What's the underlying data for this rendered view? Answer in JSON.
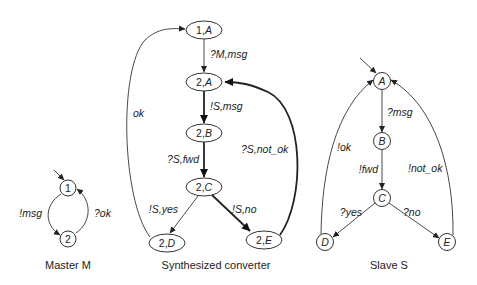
{
  "master": {
    "caption": "Master M",
    "nodes": [
      "1",
      "2"
    ],
    "edges": [
      {
        "from": "1",
        "to": "2",
        "label": "!msg"
      },
      {
        "from": "2",
        "to": "1",
        "label": "?ok"
      }
    ]
  },
  "converter": {
    "caption": "Synthesized converter",
    "nodes": [
      {
        "id": "1A",
        "num": "1,",
        "st": "A"
      },
      {
        "id": "2A",
        "num": "2,",
        "st": "A"
      },
      {
        "id": "2B",
        "num": "2,",
        "st": "B"
      },
      {
        "id": "2C",
        "num": "2,",
        "st": "C"
      },
      {
        "id": "2D",
        "num": "2,",
        "st": "D"
      },
      {
        "id": "2E",
        "num": "2,",
        "st": "E"
      }
    ],
    "edges": [
      {
        "from": "1,A",
        "to": "2,A",
        "label": "?M,msg"
      },
      {
        "from": "2,A",
        "to": "2,B",
        "label": "!S,msg"
      },
      {
        "from": "2,B",
        "to": "2,C",
        "label": "?S,fwd"
      },
      {
        "from": "2,C",
        "to": "2,D",
        "label": "!S,yes"
      },
      {
        "from": "2,C",
        "to": "2,E",
        "label": "!S,no"
      },
      {
        "from": "2,D",
        "to": "1,A",
        "label": "ok"
      },
      {
        "from": "2,E",
        "to": "2,A",
        "label": "?S,not_ok"
      }
    ]
  },
  "slave": {
    "caption": "Slave S",
    "nodes": [
      "A",
      "B",
      "C",
      "D",
      "E"
    ],
    "edges": [
      {
        "from": "A",
        "to": "B",
        "label": "?msg"
      },
      {
        "from": "B",
        "to": "C",
        "label": "!fwd"
      },
      {
        "from": "C",
        "to": "D",
        "label": "?yes"
      },
      {
        "from": "C",
        "to": "E",
        "label": "?no"
      },
      {
        "from": "D",
        "to": "A",
        "label": "!ok"
      },
      {
        "from": "E",
        "to": "A",
        "label": "!not_ok"
      }
    ]
  }
}
